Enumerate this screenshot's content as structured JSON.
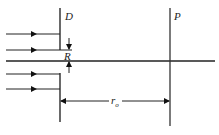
{
  "diagram": {
    "labels": {
      "screen": "D",
      "plane": "P",
      "aperture_radius": "R",
      "distance": "r",
      "distance_subscript": "o"
    },
    "colors": {
      "line": "#1a1a1a",
      "axis": "#222222"
    },
    "incident_rays": 4
  }
}
